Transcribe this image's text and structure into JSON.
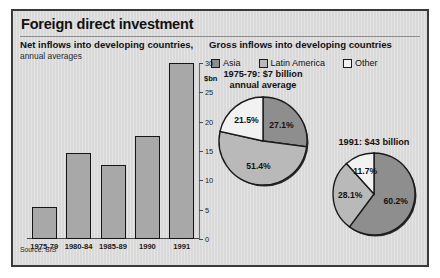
{
  "figure": {
    "title": "Foreign direct investment",
    "source": "Source: BIS",
    "left_panel": {
      "heading": "Net inflows into developing countries,",
      "subheading": "annual averages"
    },
    "right_panel": {
      "heading": "Gross inflows into developing countries"
    },
    "legend": [
      {
        "label": "Asia",
        "color": "#8e8e8e"
      },
      {
        "label": "Latin America",
        "color": "#b9b9b9"
      },
      {
        "label": "Other",
        "color": "#f2f2f2"
      }
    ]
  },
  "chart_data": [
    {
      "type": "bar",
      "title": "Net inflows into developing countries, annual averages",
      "categories": [
        "1975-79",
        "1980-84",
        "1985-89",
        "1990",
        "1991"
      ],
      "values": [
        5.5,
        14.7,
        12.7,
        17.5,
        30.0
      ],
      "xlabel": "",
      "ylabel": "$bn",
      "ylim": [
        0,
        30
      ],
      "yticks": [
        0,
        5,
        10,
        15,
        20,
        25,
        30
      ],
      "ytick_labels": [
        "0",
        "5",
        "10",
        "15",
        "20",
        "25",
        "30"
      ],
      "grid": false,
      "bar_color": "#a8a8a8"
    },
    {
      "type": "pie",
      "title": "1975-79: $7 billion annual average",
      "title_line1": "1975-79: $7 billion",
      "title_line2": "annual average",
      "labels": [
        "Asia",
        "Latin America",
        "Other"
      ],
      "values": [
        27.1,
        51.4,
        21.5
      ],
      "value_labels": [
        "27.1%",
        "51.4%",
        "21.5%"
      ],
      "colors": [
        "#8e8e8e",
        "#b9b9b9",
        "#f2f2f2"
      ],
      "start_angle_deg": 0,
      "direction": "clockwise",
      "legend_position": "top"
    },
    {
      "type": "pie",
      "title": "1991: $43 billion",
      "title_line1": "1991: $43 billion",
      "title_line2": "",
      "labels": [
        "Asia",
        "Latin America",
        "Other"
      ],
      "values": [
        60.2,
        28.1,
        11.7
      ],
      "value_labels": [
        "60.2%",
        "28.1%",
        "11.7%"
      ],
      "colors": [
        "#8e8e8e",
        "#b9b9b9",
        "#f2f2f2"
      ],
      "start_angle_deg": 0,
      "direction": "clockwise",
      "legend_position": "top"
    }
  ]
}
